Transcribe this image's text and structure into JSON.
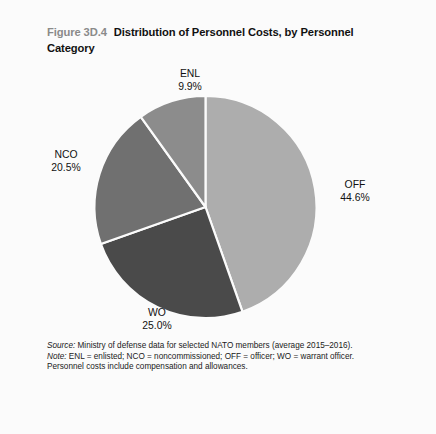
{
  "figure": {
    "number": "Figure 3D.4",
    "title": "Distribution of Personnel Costs, by Personnel Category"
  },
  "chart_data": {
    "type": "pie",
    "title": "Distribution of Personnel Costs, by Personnel Category",
    "categories": [
      "OFF",
      "WO",
      "NCO",
      "ENL"
    ],
    "values": [
      44.6,
      25.0,
      20.5,
      9.9
    ],
    "unit": "percent",
    "labels": [
      "44.6%",
      "25.0%",
      "20.5%",
      "9.9%"
    ],
    "colors": [
      "#adadad",
      "#4a4a4a",
      "#707070",
      "#8c8c8c"
    ],
    "start_angle_deg": 0,
    "direction": "clockwise",
    "legend": "none",
    "grid": false,
    "slices": [
      {
        "name": "OFF",
        "value": 44.6,
        "label": "44.6%",
        "color": "#adadad"
      },
      {
        "name": "WO",
        "value": 25.0,
        "label": "25.0%",
        "color": "#4a4a4a"
      },
      {
        "name": "NCO",
        "value": 20.5,
        "label": "20.5%",
        "color": "#707070"
      },
      {
        "name": "ENL",
        "value": 9.9,
        "label": "9.9%",
        "color": "#8c8c8c"
      }
    ]
  },
  "notes": {
    "source_lead": "Source:",
    "source_text": " Ministry of defense data for selected NATO members (average 2015–2016).",
    "note_lead": "Note:",
    "note_text": " ENL = enlisted; NCO = noncommissioned; OFF = officer; WO = warrant officer. Personnel costs include compensation and allowances."
  }
}
